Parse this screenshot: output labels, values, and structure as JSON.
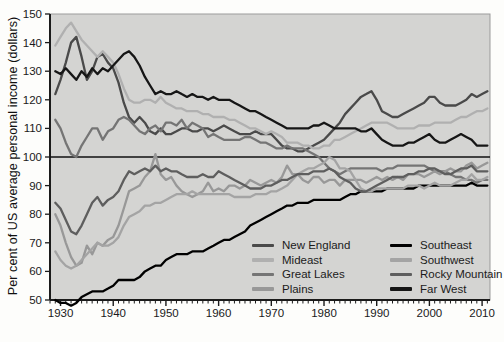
{
  "figure": {
    "background": "#fdfdfb",
    "plot_bg": "#d4d4d2",
    "axis_color": "#1b1b1b",
    "tick_label_color": "#1a1a1a",
    "border_color": "#9b9b9b"
  },
  "chart_data": {
    "type": "line",
    "ylabel": "Per cent of US average personal income (dollars)",
    "xlabel": "",
    "x_range": [
      1928,
      2011.5
    ],
    "y_range": [
      50,
      150
    ],
    "x_ticks": [
      1930,
      1940,
      1950,
      1960,
      1970,
      1980,
      1990,
      2000,
      2010
    ],
    "y_ticks": [
      50,
      60,
      70,
      80,
      90,
      100,
      110,
      120,
      130,
      140,
      150
    ],
    "reference_line_y": 100,
    "grid": false,
    "legend_position": "lower-right",
    "years": [
      1929,
      1930,
      1931,
      1932,
      1933,
      1934,
      1935,
      1936,
      1937,
      1938,
      1939,
      1940,
      1941,
      1942,
      1943,
      1944,
      1945,
      1946,
      1947,
      1948,
      1949,
      1950,
      1951,
      1952,
      1953,
      1954,
      1955,
      1956,
      1957,
      1958,
      1959,
      1960,
      1961,
      1962,
      1963,
      1964,
      1965,
      1966,
      1967,
      1968,
      1969,
      1970,
      1971,
      1972,
      1973,
      1974,
      1975,
      1976,
      1977,
      1978,
      1979,
      1980,
      1981,
      1982,
      1983,
      1984,
      1985,
      1986,
      1987,
      1988,
      1989,
      1990,
      1991,
      1992,
      1993,
      1994,
      1995,
      1996,
      1997,
      1998,
      1999,
      2000,
      2001,
      2002,
      2003,
      2004,
      2005,
      2006,
      2007,
      2008,
      2009,
      2010,
      2011
    ],
    "series": [
      {
        "name": "New England",
        "color": "#4a4a4a",
        "values": [
          122,
          127,
          133,
          140,
          142,
          135,
          127,
          130,
          135,
          136,
          133,
          131,
          126,
          119,
          114,
          112,
          114,
          112,
          109,
          108,
          110,
          108,
          108,
          109,
          110,
          110,
          109,
          109,
          110,
          110,
          109,
          110,
          111,
          110,
          109,
          108,
          108,
          108,
          109,
          108,
          108,
          108,
          106,
          104,
          103,
          103,
          102,
          102,
          103,
          104,
          105,
          106,
          108,
          110,
          112,
          115,
          117,
          119,
          121,
          122,
          123,
          120,
          116,
          115,
          114,
          114,
          115,
          116,
          117,
          118,
          119,
          121,
          121,
          119,
          118,
          118,
          118,
          119,
          120,
          122,
          121,
          122,
          123
        ]
      },
      {
        "name": "Mideast",
        "color": "#b0b0b0",
        "values": [
          139,
          142,
          145,
          147,
          144,
          141,
          139,
          137,
          135,
          137,
          135,
          133,
          129,
          124,
          120,
          119,
          119,
          120,
          120,
          119,
          121,
          119,
          118,
          117,
          117,
          116,
          116,
          116,
          115,
          115,
          114,
          114,
          114,
          113,
          113,
          112,
          111,
          110,
          110,
          109,
          108,
          109,
          108,
          107,
          105,
          105,
          105,
          104,
          104,
          103,
          103,
          104,
          104,
          106,
          106,
          107,
          108,
          109,
          110,
          111,
          112,
          112,
          112,
          112,
          111,
          110,
          110,
          110,
          110,
          111,
          111,
          111,
          112,
          112,
          112,
          112,
          113,
          114,
          114,
          115,
          116,
          116,
          117
        ]
      },
      {
        "name": "Great Lakes",
        "color": "#757575",
        "values": [
          113,
          110,
          105,
          101,
          100,
          104,
          107,
          110,
          110,
          106,
          109,
          110,
          113,
          114,
          113,
          111,
          109,
          108,
          110,
          111,
          109,
          112,
          112,
          111,
          113,
          110,
          112,
          111,
          110,
          107,
          108,
          107,
          106,
          106,
          106,
          106,
          107,
          107,
          106,
          105,
          105,
          104,
          103,
          103,
          104,
          103,
          103,
          103,
          102,
          101,
          100,
          98,
          96,
          95,
          94,
          95,
          96,
          96,
          96,
          96,
          96,
          96,
          95,
          96,
          96,
          97,
          97,
          97,
          97,
          97,
          97,
          96,
          95,
          95,
          95,
          94,
          93,
          93,
          92,
          92,
          91,
          92,
          92
        ]
      },
      {
        "name": "Plains",
        "color": "#989898",
        "values": [
          80,
          76,
          70,
          65,
          62,
          63,
          69,
          66,
          70,
          69,
          71,
          72,
          76,
          82,
          88,
          89,
          90,
          93,
          95,
          101,
          94,
          92,
          93,
          90,
          88,
          87,
          86,
          87,
          88,
          91,
          88,
          89,
          88,
          90,
          90,
          89,
          90,
          92,
          91,
          90,
          91,
          92,
          91,
          93,
          97,
          94,
          94,
          92,
          91,
          93,
          93,
          91,
          92,
          92,
          90,
          92,
          92,
          92,
          92,
          91,
          92,
          93,
          92,
          93,
          92,
          93,
          92,
          94,
          94,
          94,
          93,
          94,
          95,
          94,
          95,
          96,
          95,
          95,
          97,
          98,
          96,
          97,
          98
        ]
      },
      {
        "name": "Southeast",
        "color": "#000000",
        "values": [
          50,
          49,
          49,
          48,
          49,
          51,
          52,
          53,
          53,
          53,
          54,
          55,
          57,
          57,
          57,
          57,
          58,
          60,
          61,
          62,
          62,
          64,
          65,
          66,
          66,
          66,
          67,
          67,
          67,
          68,
          69,
          70,
          71,
          71,
          72,
          73,
          74,
          76,
          77,
          78,
          79,
          80,
          81,
          82,
          83,
          83,
          84,
          84,
          84,
          85,
          85,
          85,
          85,
          85,
          85,
          86,
          87,
          87,
          88,
          88,
          88,
          88,
          88,
          89,
          89,
          89,
          89,
          89,
          89,
          90,
          90,
          90,
          90,
          90,
          90,
          90,
          90,
          90,
          90,
          91,
          90,
          90,
          90
        ]
      },
      {
        "name": "Southwest",
        "color": "#a4a4a4",
        "values": [
          67,
          64,
          62,
          61,
          62,
          64,
          66,
          68,
          70,
          69,
          69,
          70,
          72,
          76,
          79,
          80,
          81,
          83,
          83,
          84,
          84,
          85,
          86,
          87,
          87,
          87,
          88,
          87,
          87,
          87,
          87,
          87,
          87,
          87,
          86,
          86,
          86,
          86,
          87,
          87,
          87,
          88,
          88,
          89,
          90,
          92,
          94,
          95,
          96,
          96,
          97,
          98,
          100,
          99,
          96,
          96,
          95,
          92,
          89,
          88,
          88,
          89,
          89,
          89,
          89,
          89,
          89,
          90,
          90,
          90,
          89,
          90,
          91,
          90,
          90,
          90,
          91,
          92,
          92,
          94,
          92,
          92,
          93
        ]
      },
      {
        "name": "Rocky Mountain",
        "color": "#5e5e5e",
        "values": [
          84,
          82,
          78,
          74,
          73,
          76,
          80,
          84,
          86,
          83,
          85,
          86,
          88,
          92,
          95,
          94,
          95,
          96,
          95,
          97,
          95,
          96,
          95,
          95,
          94,
          93,
          93,
          93,
          94,
          93,
          93,
          95,
          94,
          93,
          92,
          91,
          90,
          89,
          89,
          89,
          90,
          90,
          91,
          92,
          92,
          93,
          94,
          94,
          94,
          95,
          95,
          95,
          96,
          95,
          93,
          92,
          91,
          89,
          88,
          88,
          89,
          90,
          91,
          92,
          93,
          93,
          93,
          94,
          94,
          95,
          95,
          96,
          96,
          95,
          94,
          94,
          95,
          96,
          96,
          97,
          95,
          95,
          95
        ]
      },
      {
        "name": "Far West",
        "color": "#161616",
        "values": [
          130,
          129,
          131,
          129,
          127,
          130,
          128,
          131,
          129,
          131,
          130,
          132,
          134,
          136,
          137,
          135,
          132,
          128,
          125,
          122,
          123,
          122,
          122,
          123,
          122,
          121,
          122,
          121,
          121,
          120,
          121,
          120,
          120,
          120,
          119,
          118,
          117,
          116,
          116,
          115,
          114,
          113,
          112,
          111,
          110,
          110,
          110,
          110,
          110,
          111,
          111,
          112,
          111,
          110,
          110,
          110,
          110,
          110,
          109,
          109,
          110,
          108,
          106,
          105,
          104,
          104,
          104,
          105,
          105,
          106,
          107,
          108,
          106,
          105,
          105,
          106,
          107,
          108,
          107,
          106,
          104,
          104,
          104
        ]
      }
    ],
    "legend_columns": [
      [
        "New England",
        "Mideast",
        "Great Lakes",
        "Plains"
      ],
      [
        "Southeast",
        "Southwest",
        "Rocky Mountain",
        "Far West"
      ]
    ]
  }
}
